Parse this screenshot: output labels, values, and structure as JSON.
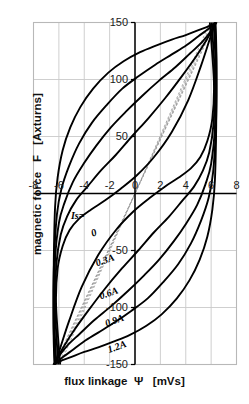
{
  "chart_data": {
    "type": "line",
    "title": "",
    "xlabel": "flux linkage  Ψ   [mVs]",
    "ylabel": "magnetic force   F   [Axturns]",
    "xlim": [
      -8,
      8
    ],
    "ylim": [
      -150,
      150
    ],
    "xticks": [
      -8,
      -6,
      -4,
      -2,
      0,
      2,
      4,
      6,
      8
    ],
    "xtick_labels": [
      "-8",
      "-6",
      "-4",
      "-2",
      "0",
      "2",
      "4",
      "6",
      "8"
    ],
    "yticks": [
      -150,
      -100,
      -50,
      0,
      50,
      100,
      150
    ],
    "ytick_labels": [
      "-150",
      "-100",
      "-50",
      "",
      "50",
      "100",
      "150"
    ],
    "grid": true,
    "legend": "inline-annotations",
    "legend_title": "Is=",
    "series": [
      {
        "name": "0",
        "label": "0",
        "bias_current_A": 0,
        "style": "solid",
        "saturation_flux_mVs": 6.45,
        "peak_force_Axturns": 150,
        "coercive_force_Axturns": 28,
        "remanent_flux_mVs": 5.9,
        "upper_branch": [
          [
            -6.35,
            -150
          ],
          [
            -6.42,
            -118
          ],
          [
            -6.4,
            -60
          ],
          [
            -6.3,
            -12
          ],
          [
            -6.1,
            14
          ],
          [
            -5.7,
            38
          ],
          [
            -5.1,
            58
          ],
          [
            -4.3,
            76
          ],
          [
            -3.3,
            92
          ],
          [
            -2.1,
            106
          ],
          [
            -0.9,
            116
          ],
          [
            0.4,
            124
          ],
          [
            1.7,
            130
          ],
          [
            2.9,
            135
          ],
          [
            4.0,
            139
          ],
          [
            4.95,
            143
          ],
          [
            5.65,
            146
          ],
          [
            6.1,
            148
          ],
          [
            6.35,
            150
          ]
        ],
        "lower_branch": [
          [
            6.35,
            150
          ],
          [
            6.42,
            118
          ],
          [
            6.4,
            60
          ],
          [
            6.3,
            12
          ],
          [
            6.1,
            -14
          ],
          [
            5.7,
            -38
          ],
          [
            5.1,
            -58
          ],
          [
            4.3,
            -76
          ],
          [
            3.3,
            -92
          ],
          [
            2.1,
            -106
          ],
          [
            0.9,
            -116
          ],
          [
            -0.4,
            -124
          ],
          [
            -1.7,
            -130
          ],
          [
            -2.9,
            -135
          ],
          [
            -4.0,
            -139
          ],
          [
            -4.95,
            -143
          ],
          [
            -5.65,
            -146
          ],
          [
            -6.1,
            -148
          ],
          [
            -6.35,
            -150
          ]
        ],
        "mean_line": [
          [
            -6.35,
            -150
          ],
          [
            6.35,
            150
          ]
        ]
      },
      {
        "name": "0.3A",
        "label": "0.3A",
        "bias_current_A": 0.3,
        "style": "solid",
        "saturation_flux_mVs": 6.45,
        "peak_force_Axturns": 150,
        "coercive_force_Axturns": 55,
        "remanent_flux_mVs": 5.2,
        "upper_branch": [
          [
            -6.3,
            -150
          ],
          [
            -6.42,
            -110
          ],
          [
            -6.38,
            -60
          ],
          [
            -6.15,
            -18
          ],
          [
            -5.8,
            4
          ],
          [
            -5.2,
            24
          ],
          [
            -4.4,
            44
          ],
          [
            -3.4,
            62
          ],
          [
            -2.2,
            78
          ],
          [
            -1.0,
            92
          ],
          [
            0.3,
            103
          ],
          [
            1.6,
            113
          ],
          [
            2.9,
            122
          ],
          [
            4.05,
            130
          ],
          [
            5.0,
            138
          ],
          [
            5.75,
            144
          ],
          [
            6.2,
            148
          ],
          [
            6.4,
            150
          ]
        ],
        "lower_branch": [
          [
            6.3,
            150
          ],
          [
            6.42,
            110
          ],
          [
            6.38,
            60
          ],
          [
            6.15,
            18
          ],
          [
            5.8,
            -4
          ],
          [
            5.2,
            -24
          ],
          [
            4.4,
            -44
          ],
          [
            3.4,
            -62
          ],
          [
            2.2,
            -78
          ],
          [
            1.0,
            -92
          ],
          [
            -0.3,
            -103
          ],
          [
            -1.6,
            -113
          ],
          [
            -2.9,
            -122
          ],
          [
            -4.05,
            -130
          ],
          [
            -5.0,
            -138
          ],
          [
            -5.75,
            -144
          ],
          [
            -6.2,
            -148
          ],
          [
            -6.4,
            -150
          ]
        ],
        "mean_line": [
          [
            -6.3,
            -150
          ],
          [
            6.3,
            150
          ]
        ]
      },
      {
        "name": "0.6A",
        "label": "0.6A",
        "bias_current_A": 0.6,
        "style": "solid",
        "saturation_flux_mVs": 6.4,
        "peak_force_Axturns": 150,
        "coercive_force_Axturns": 88,
        "remanent_flux_mVs": 4.2,
        "upper_branch": [
          [
            -6.2,
            -150
          ],
          [
            -6.38,
            -104
          ],
          [
            -6.3,
            -58
          ],
          [
            -6.0,
            -26
          ],
          [
            -5.55,
            -8
          ],
          [
            -4.9,
            10
          ],
          [
            -4.05,
            26
          ],
          [
            -3.05,
            42
          ],
          [
            -1.9,
            58
          ],
          [
            -0.7,
            72
          ],
          [
            0.6,
            86
          ],
          [
            1.9,
            99
          ],
          [
            3.2,
            111
          ],
          [
            4.35,
            123
          ],
          [
            5.3,
            133
          ],
          [
            5.95,
            142
          ],
          [
            6.3,
            148
          ],
          [
            6.42,
            150
          ]
        ],
        "lower_branch": [
          [
            6.2,
            150
          ],
          [
            6.38,
            104
          ],
          [
            6.3,
            58
          ],
          [
            6.0,
            26
          ],
          [
            5.55,
            8
          ],
          [
            4.9,
            -10
          ],
          [
            4.05,
            -26
          ],
          [
            3.05,
            -42
          ],
          [
            1.9,
            -58
          ],
          [
            0.7,
            -72
          ],
          [
            -0.6,
            -86
          ],
          [
            -1.9,
            -99
          ],
          [
            -3.2,
            -111
          ],
          [
            -4.35,
            -123
          ],
          [
            -5.3,
            -133
          ],
          [
            -5.95,
            -142
          ],
          [
            -6.3,
            -148
          ],
          [
            -6.42,
            -150
          ]
        ],
        "mean_line": [
          [
            -6.2,
            -150
          ],
          [
            6.2,
            150
          ]
        ]
      },
      {
        "name": "0.9A",
        "label": "0.9A",
        "bias_current_A": 0.9,
        "style": "solid",
        "saturation_flux_mVs": 6.35,
        "peak_force_Axturns": 150,
        "coercive_force_Axturns": 116,
        "remanent_flux_mVs": 3.0,
        "upper_branch": [
          [
            -6.05,
            -150
          ],
          [
            -6.3,
            -100
          ],
          [
            -6.2,
            -62
          ],
          [
            -5.85,
            -36
          ],
          [
            -5.35,
            -20
          ],
          [
            -4.65,
            -6
          ],
          [
            -3.75,
            6
          ],
          [
            -2.7,
            20
          ],
          [
            -1.5,
            34
          ],
          [
            -0.25,
            50
          ],
          [
            1.05,
            66
          ],
          [
            2.4,
            84
          ],
          [
            3.7,
            103
          ],
          [
            4.8,
            120
          ],
          [
            5.6,
            134
          ],
          [
            6.1,
            144
          ],
          [
            6.35,
            150
          ]
        ],
        "lower_branch": [
          [
            6.05,
            150
          ],
          [
            6.3,
            100
          ],
          [
            6.2,
            62
          ],
          [
            5.85,
            36
          ],
          [
            5.35,
            20
          ],
          [
            4.65,
            6
          ],
          [
            3.75,
            -6
          ],
          [
            2.7,
            -20
          ],
          [
            1.5,
            -34
          ],
          [
            0.25,
            -50
          ],
          [
            -1.05,
            -66
          ],
          [
            -2.4,
            -84
          ],
          [
            -3.7,
            -103
          ],
          [
            -4.8,
            -120
          ],
          [
            -5.6,
            -134
          ],
          [
            -6.1,
            -144
          ],
          [
            -6.35,
            -150
          ]
        ],
        "mean_line": [
          [
            -6.05,
            -150
          ],
          [
            6.05,
            150
          ]
        ]
      },
      {
        "name": "1.2A",
        "label": "1.2A",
        "bias_current_A": 1.2,
        "style": "solid",
        "saturation_flux_mVs": 6.3,
        "peak_force_Axturns": 150,
        "coercive_force_Axturns": 140,
        "remanent_flux_mVs": 2.0,
        "upper_branch": [
          [
            -5.9,
            -150
          ],
          [
            -6.22,
            -98
          ],
          [
            -6.1,
            -66
          ],
          [
            -5.7,
            -46
          ],
          [
            -5.15,
            -32
          ],
          [
            -4.4,
            -22
          ],
          [
            -3.45,
            -14
          ],
          [
            -2.35,
            -6
          ],
          [
            -1.15,
            4
          ],
          [
            0.15,
            16
          ],
          [
            1.5,
            32
          ],
          [
            2.9,
            54
          ],
          [
            4.2,
            82
          ],
          [
            5.2,
            112
          ],
          [
            5.85,
            134
          ],
          [
            6.2,
            146
          ],
          [
            6.3,
            150
          ]
        ],
        "lower_branch": [
          [
            5.9,
            150
          ],
          [
            6.22,
            98
          ],
          [
            6.1,
            66
          ],
          [
            5.7,
            46
          ],
          [
            5.15,
            32
          ],
          [
            4.4,
            22
          ],
          [
            3.45,
            14
          ],
          [
            2.35,
            6
          ],
          [
            1.15,
            -4
          ],
          [
            -0.15,
            -16
          ],
          [
            -1.5,
            -32
          ],
          [
            -2.9,
            -54
          ],
          [
            -4.2,
            -82
          ],
          [
            -5.2,
            -112
          ],
          [
            -5.85,
            -134
          ],
          [
            -6.2,
            -146
          ],
          [
            -6.3,
            -150
          ]
        ],
        "mean_line": [
          [
            -5.9,
            -150
          ],
          [
            5.9,
            150
          ]
        ]
      }
    ],
    "annotations": [
      {
        "text": "Is=",
        "x": -5.05,
        "y": -22,
        "rotation": 0,
        "style": "italic-bold"
      },
      {
        "text": "0",
        "x": -3.35,
        "y": -38,
        "rotation": -20,
        "style": "italic-bold"
      },
      {
        "text": "0.3A",
        "x": -3.0,
        "y": -64,
        "rotation": -20,
        "style": "italic-bold"
      },
      {
        "text": "0.6A",
        "x": -2.7,
        "y": -93,
        "rotation": -20,
        "style": "italic-bold"
      },
      {
        "text": "0.9A",
        "x": -2.25,
        "y": -117,
        "rotation": -20,
        "style": "italic-bold"
      },
      {
        "text": "1.2A",
        "x": -2.05,
        "y": -140,
        "rotation": -20,
        "style": "italic-bold"
      }
    ],
    "colors": {
      "curve": "#000000",
      "mean_line": "#9a9a9a",
      "grid": "#c9c9c9",
      "frame": "#b8b8b8",
      "axis": "#000000",
      "text": "#111111"
    }
  }
}
